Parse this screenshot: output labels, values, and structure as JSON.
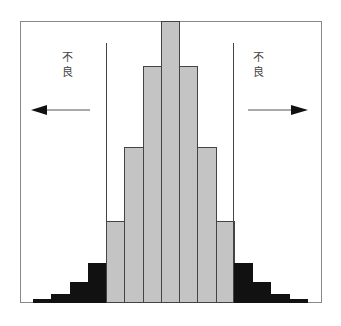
{
  "diagram": {
    "left_label": "不良",
    "right_label": "不良",
    "left_label_chars": [
      "不",
      "良"
    ],
    "right_label_chars": [
      "不",
      "良"
    ],
    "left_arrow": "arrow-left",
    "right_arrow": "arrow-right",
    "colors": {
      "in_spec": "#c4c4c4",
      "out_of_spec": "#111111",
      "frame": "#888888",
      "limit_line": "#444444"
    }
  },
  "chart_data": {
    "type": "bar",
    "title": "",
    "xlabel": "",
    "ylabel": "",
    "categories": [
      "1",
      "2",
      "3",
      "4",
      "5",
      "6",
      "7",
      "8",
      "9",
      "10",
      "11",
      "12",
      "13",
      "14",
      "15"
    ],
    "values": [
      1,
      3,
      7,
      14,
      29,
      55,
      84,
      100,
      84,
      55,
      29,
      14,
      7,
      3,
      1
    ],
    "bar_colors": [
      "black",
      "black",
      "black",
      "black",
      "gray",
      "gray",
      "gray",
      "gray",
      "gray",
      "gray",
      "gray",
      "black",
      "black",
      "black",
      "black"
    ],
    "annotations": [
      {
        "text": "不良",
        "position": "left",
        "arrow": "left"
      },
      {
        "text": "不良",
        "position": "right",
        "arrow": "right"
      }
    ],
    "spec_limits": {
      "lower_between_bars": [
        4,
        5
      ],
      "upper_between_bars": [
        11,
        12
      ]
    },
    "grid": false,
    "legend": null
  }
}
